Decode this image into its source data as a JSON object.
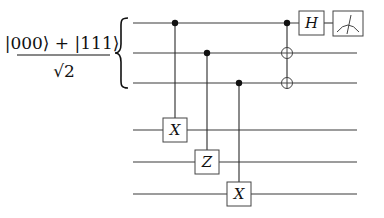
{
  "diagram": {
    "type": "quantum-circuit",
    "input_state": {
      "numerator": "|000⟩ + |111⟩",
      "denominator": "√2",
      "brace_groups_qubits": [
        0,
        1,
        2
      ]
    },
    "qubits": [
      {
        "index": 0,
        "y": 23,
        "x_start": 133,
        "x_end": 357
      },
      {
        "index": 1,
        "y": 53,
        "x_start": 133,
        "x_end": 357
      },
      {
        "index": 2,
        "y": 83,
        "x_start": 133,
        "x_end": 357
      },
      {
        "index": 3,
        "y": 130,
        "x_start": 133,
        "x_end": 357
      },
      {
        "index": 4,
        "y": 162,
        "x_start": 133,
        "x_end": 357
      },
      {
        "index": 5,
        "y": 194,
        "x_start": 133,
        "x_end": 357
      }
    ],
    "gates": [
      {
        "type": "controlled",
        "control": 0,
        "target": 3,
        "label": "X",
        "x": 175
      },
      {
        "type": "controlled",
        "control": 1,
        "target": 4,
        "label": "Z",
        "x": 207
      },
      {
        "type": "controlled",
        "control": 2,
        "target": 5,
        "label": "X",
        "x": 239
      },
      {
        "type": "cnot-multi",
        "control": 0,
        "targets": [
          1,
          2
        ],
        "x": 287
      },
      {
        "type": "single",
        "qubit": 0,
        "label": "H",
        "x": 312
      },
      {
        "type": "measure",
        "qubit": 0,
        "x": 345
      }
    ]
  }
}
